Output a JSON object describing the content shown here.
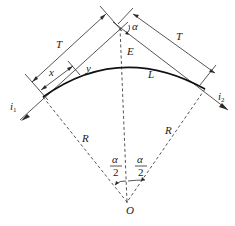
{
  "diagram": {
    "labels": {
      "tangent_left": "T",
      "tangent_right": "T",
      "x": "x",
      "y": "y",
      "deflection_angle": "α",
      "external_distance": "E",
      "curve_length": "L",
      "radius_left": "R",
      "radius_right": "R",
      "half_angle_left_num": "α",
      "half_angle_left_den": "2",
      "half_angle_right_num": "α",
      "half_angle_right_den": "2",
      "center": "O",
      "incoming_line": "i",
      "incoming_line_sub": "1",
      "outgoing_line": "i",
      "outgoing_line_sub": "2"
    },
    "colors": {
      "stroke": "#2a2a2a",
      "curve": "#111111",
      "background": "#ffffff"
    }
  }
}
